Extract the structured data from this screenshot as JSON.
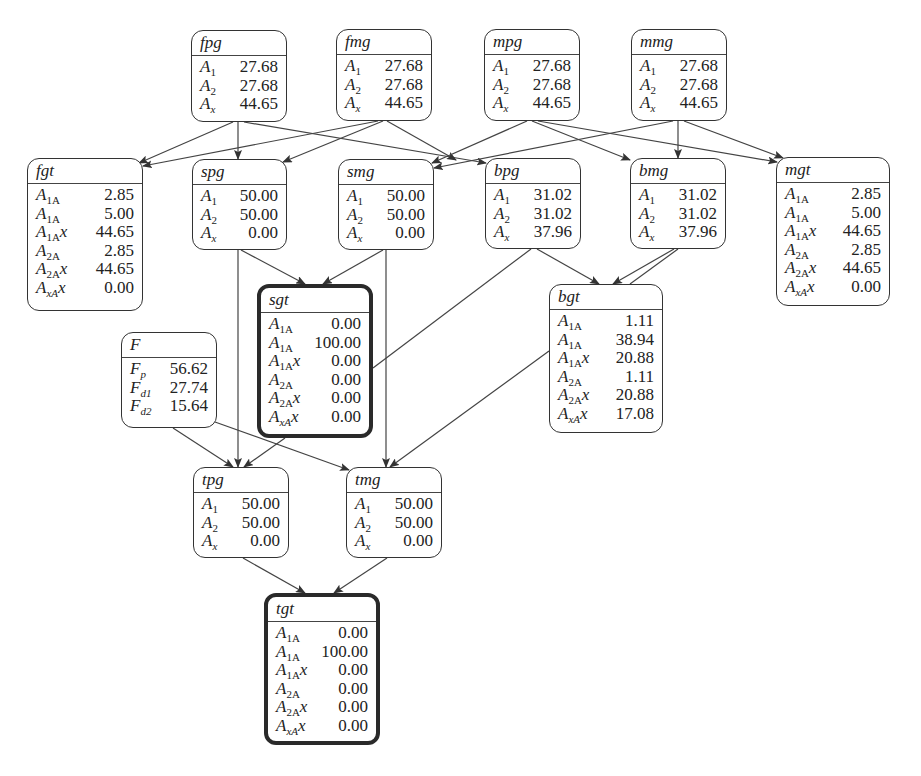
{
  "diagram": {
    "nodes": [
      {
        "id": "fpg",
        "title": "fpg",
        "x": 191,
        "y": 30,
        "w": 96,
        "h": 92,
        "thick": false,
        "rows": [
          {
            "label": "A_1",
            "value": "27.68"
          },
          {
            "label": "A_2",
            "value": "27.68"
          },
          {
            "label": "A_x",
            "value": "44.65"
          }
        ]
      },
      {
        "id": "fmg",
        "title": "fmg",
        "x": 336,
        "y": 29,
        "w": 96,
        "h": 92,
        "thick": false,
        "rows": [
          {
            "label": "A_1",
            "value": "27.68"
          },
          {
            "label": "A_2",
            "value": "27.68"
          },
          {
            "label": "A_x",
            "value": "44.65"
          }
        ]
      },
      {
        "id": "mpg",
        "title": "mpg",
        "x": 484,
        "y": 29,
        "w": 96,
        "h": 92,
        "thick": false,
        "rows": [
          {
            "label": "A_1",
            "value": "27.68"
          },
          {
            "label": "A_2",
            "value": "27.68"
          },
          {
            "label": "A_x",
            "value": "44.65"
          }
        ]
      },
      {
        "id": "mmg",
        "title": "mmg",
        "x": 631,
        "y": 29,
        "w": 96,
        "h": 92,
        "thick": false,
        "rows": [
          {
            "label": "A_1",
            "value": "27.68"
          },
          {
            "label": "A_2",
            "value": "27.68"
          },
          {
            "label": "A_x",
            "value": "44.65"
          }
        ]
      },
      {
        "id": "fgt",
        "title": "fgt",
        "x": 27,
        "y": 158,
        "w": 116,
        "h": 153,
        "thick": false,
        "rows": [
          {
            "label": "A_1A_1",
            "value": "2.85"
          },
          {
            "label": "A_1A_2",
            "value": "5.00"
          },
          {
            "label": "A_1A_x",
            "value": "44.65"
          },
          {
            "label": "A_2A_2",
            "value": "2.85"
          },
          {
            "label": "A_2A_x",
            "value": "44.65"
          },
          {
            "label": "A_xA_x",
            "value": "0.00"
          }
        ]
      },
      {
        "id": "spg",
        "title": "spg",
        "x": 192,
        "y": 159,
        "w": 95,
        "h": 91,
        "thick": false,
        "rows": [
          {
            "label": "A_1",
            "value": "50.00"
          },
          {
            "label": "A_2",
            "value": "50.00"
          },
          {
            "label": "A_x",
            "value": "0.00"
          }
        ]
      },
      {
        "id": "smg",
        "title": "smg",
        "x": 338,
        "y": 159,
        "w": 96,
        "h": 91,
        "thick": false,
        "rows": [
          {
            "label": "A_1",
            "value": "50.00"
          },
          {
            "label": "A_2",
            "value": "50.00"
          },
          {
            "label": "A_x",
            "value": "0.00"
          }
        ]
      },
      {
        "id": "bpg",
        "title": "bpg",
        "x": 485,
        "y": 158,
        "w": 96,
        "h": 91,
        "thick": false,
        "rows": [
          {
            "label": "A_1",
            "value": "31.02"
          },
          {
            "label": "A_2",
            "value": "31.02"
          },
          {
            "label": "A_x",
            "value": "37.96"
          }
        ]
      },
      {
        "id": "bmg",
        "title": "bmg",
        "x": 630,
        "y": 158,
        "w": 96,
        "h": 91,
        "thick": false,
        "rows": [
          {
            "label": "A_1",
            "value": "31.02"
          },
          {
            "label": "A_2",
            "value": "31.02"
          },
          {
            "label": "A_x",
            "value": "37.96"
          }
        ]
      },
      {
        "id": "mgt",
        "title": "mgt",
        "x": 776,
        "y": 157,
        "w": 114,
        "h": 149,
        "thick": false,
        "rows": [
          {
            "label": "A_1A_1",
            "value": "2.85"
          },
          {
            "label": "A_1A_2",
            "value": "5.00"
          },
          {
            "label": "A_1A_x",
            "value": "44.65"
          },
          {
            "label": "A_2A_2",
            "value": "2.85"
          },
          {
            "label": "A_2A_x",
            "value": "44.65"
          },
          {
            "label": "A_xA_x",
            "value": "0.00"
          }
        ]
      },
      {
        "id": "sgt",
        "title": "sgt",
        "x": 257,
        "y": 284,
        "w": 116,
        "h": 154,
        "thick": true,
        "rows": [
          {
            "label": "A_1A_1",
            "value": "0.00"
          },
          {
            "label": "A_1A_2",
            "value": "100.00"
          },
          {
            "label": "A_1A_x",
            "value": "0.00"
          },
          {
            "label": "A_2A_2",
            "value": "0.00"
          },
          {
            "label": "A_2A_x",
            "value": "0.00"
          },
          {
            "label": "A_xA_x",
            "value": "0.00"
          }
        ]
      },
      {
        "id": "bgt",
        "title": "bgt",
        "x": 549,
        "y": 284,
        "w": 114,
        "h": 149,
        "thick": false,
        "rows": [
          {
            "label": "A_1A_1",
            "value": "1.11"
          },
          {
            "label": "A_1A_2",
            "value": "38.94"
          },
          {
            "label": "A_1A_x",
            "value": "20.88"
          },
          {
            "label": "A_2A_2",
            "value": "1.11"
          },
          {
            "label": "A_2A_x",
            "value": "20.88"
          },
          {
            "label": "A_xA_x",
            "value": "17.08"
          }
        ]
      },
      {
        "id": "F",
        "title": "F",
        "x": 121,
        "y": 332,
        "w": 96,
        "h": 96,
        "thick": false,
        "rows": [
          {
            "label": "F_p",
            "value": "56.62"
          },
          {
            "label": "F_d1",
            "value": "27.74"
          },
          {
            "label": "F_d2",
            "value": "15.64"
          }
        ]
      },
      {
        "id": "tpg",
        "title": "tpg",
        "x": 193,
        "y": 467,
        "w": 96,
        "h": 91,
        "thick": false,
        "rows": [
          {
            "label": "A_1",
            "value": "50.00"
          },
          {
            "label": "A_2",
            "value": "50.00"
          },
          {
            "label": "A_x",
            "value": "0.00"
          }
        ]
      },
      {
        "id": "tmg",
        "title": "tmg",
        "x": 346,
        "y": 467,
        "w": 96,
        "h": 91,
        "thick": false,
        "rows": [
          {
            "label": "A_1",
            "value": "50.00"
          },
          {
            "label": "A_2",
            "value": "50.00"
          },
          {
            "label": "A_x",
            "value": "0.00"
          }
        ]
      },
      {
        "id": "tgt",
        "title": "tgt",
        "x": 264,
        "y": 593,
        "w": 116,
        "h": 152,
        "thick": true,
        "rows": [
          {
            "label": "A_1A_1",
            "value": "0.00"
          },
          {
            "label": "A_1A_2",
            "value": "100.00"
          },
          {
            "label": "A_1A_x",
            "value": "0.00"
          },
          {
            "label": "A_2A_2",
            "value": "0.00"
          },
          {
            "label": "A_2A_x",
            "value": "0.00"
          },
          {
            "label": "A_xA_x",
            "value": "0.00"
          }
        ]
      }
    ],
    "edges": [
      {
        "from": "fpg",
        "to": "fgt",
        "x1": 233,
        "y1": 122,
        "x2": 139,
        "y2": 163
      },
      {
        "from": "fpg",
        "to": "spg",
        "x1": 238,
        "y1": 122,
        "x2": 238,
        "y2": 159
      },
      {
        "from": "fpg",
        "to": "bpg",
        "x1": 244,
        "y1": 122,
        "x2": 486,
        "y2": 163
      },
      {
        "from": "fmg",
        "to": "fgt",
        "x1": 378,
        "y1": 121,
        "x2": 143,
        "y2": 166
      },
      {
        "from": "fmg",
        "to": "spg",
        "x1": 383,
        "y1": 121,
        "x2": 283,
        "y2": 162
      },
      {
        "from": "fmg",
        "to": "bgt_via",
        "x1": 387,
        "y1": 121,
        "x2": 456,
        "y2": 160,
        "note": "continues to bpg"
      },
      {
        "from": "mpg",
        "to": "smg",
        "x1": 527,
        "y1": 121,
        "x2": 432,
        "y2": 163
      },
      {
        "from": "mpg",
        "to": "bmg",
        "x1": 532,
        "y1": 121,
        "x2": 630,
        "y2": 160
      },
      {
        "from": "mpg",
        "to": "mgt",
        "x1": 538,
        "y1": 121,
        "x2": 777,
        "y2": 162
      },
      {
        "from": "mmg",
        "to": "smg",
        "x1": 673,
        "y1": 121,
        "x2": 434,
        "y2": 168
      },
      {
        "from": "mmg",
        "to": "bmg",
        "x1": 678,
        "y1": 121,
        "x2": 678,
        "y2": 158
      },
      {
        "from": "mmg",
        "to": "mgt",
        "x1": 684,
        "y1": 121,
        "x2": 783,
        "y2": 158
      },
      {
        "from": "spg",
        "to": "sgt",
        "x1": 241,
        "y1": 250,
        "x2": 305,
        "y2": 284
      },
      {
        "from": "smg",
        "to": "sgt",
        "x1": 383,
        "y1": 250,
        "x2": 323,
        "y2": 284
      },
      {
        "from": "bpg",
        "to": "bgt",
        "x1": 537,
        "y1": 249,
        "x2": 599,
        "y2": 284
      },
      {
        "from": "bmg",
        "to": "bgt",
        "x1": 674,
        "y1": 249,
        "x2": 613,
        "y2": 284
      },
      {
        "from": "bmg",
        "to": "bgt2",
        "x1": 678,
        "y1": 249,
        "x2": 630,
        "y2": 284,
        "arrow": false
      },
      {
        "from": "bpg",
        "to": "sgt",
        "x1": 531,
        "y1": 249,
        "x2": 373,
        "y2": 368,
        "arrow": false
      },
      {
        "from": "spg",
        "to": "tpg",
        "x1": 238,
        "y1": 250,
        "x2": 238,
        "y2": 467
      },
      {
        "from": "smg",
        "to": "tmg",
        "x1": 386,
        "y1": 250,
        "x2": 386,
        "y2": 467
      },
      {
        "from": "sgt",
        "to": "tpg",
        "x1": 285,
        "y1": 438,
        "x2": 244,
        "y2": 467
      },
      {
        "from": "F",
        "to": "tpg",
        "x1": 173,
        "y1": 428,
        "x2": 233,
        "y2": 467
      },
      {
        "from": "F",
        "to": "tmg",
        "x1": 215,
        "y1": 422,
        "x2": 349,
        "y2": 470
      },
      {
        "from": "bgt",
        "to": "tmg",
        "x1": 549,
        "y1": 351,
        "x2": 390,
        "y2": 467
      },
      {
        "from": "tpg",
        "to": "tgt",
        "x1": 243,
        "y1": 558,
        "x2": 305,
        "y2": 593
      },
      {
        "from": "tmg",
        "to": "tgt",
        "x1": 387,
        "y1": 558,
        "x2": 334,
        "y2": 593
      }
    ]
  }
}
